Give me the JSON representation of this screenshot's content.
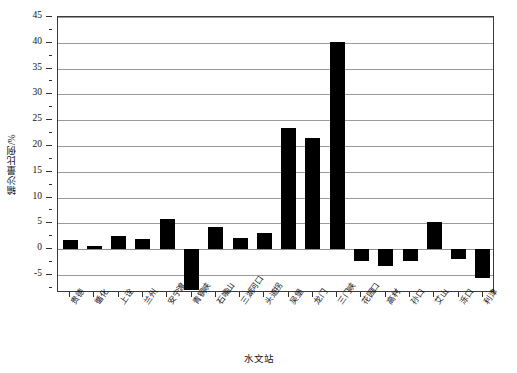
{
  "chart_data": {
    "type": "bar",
    "title": "",
    "xlabel": "水文站",
    "ylabel": "输沙量比例/%",
    "ylim": [
      -8.5,
      45
    ],
    "grid": true,
    "legend": "none",
    "bar_color": "#000000",
    "categories": [
      "贵德",
      "循化",
      "上诠",
      "兰州",
      "安宁渡",
      "青铜峡",
      "石嘴山",
      "三湖河口",
      "头道拐",
      "吴堡",
      "龙门",
      "三门峡",
      "花园口",
      "高村",
      "孙口",
      "艾山",
      "泺口",
      "利津"
    ],
    "values": [
      1.8,
      0.7,
      2.6,
      2.0,
      5.9,
      -7.9,
      4.2,
      2.2,
      3.2,
      23.4,
      21.5,
      40.2,
      -2.3,
      -3.3,
      -2.3,
      5.3,
      -1.9,
      -5.5
    ],
    "y_ticks_major": [
      45,
      40,
      35,
      30,
      25,
      20,
      15,
      10,
      5,
      0,
      -5
    ],
    "y_tick_labels": [
      "45",
      "40",
      "35",
      "30",
      "25",
      "20",
      "15",
      "10",
      "5",
      "0",
      "-5"
    ],
    "y_ticks_minor": [
      42.5,
      37.5,
      32.5,
      27.5,
      22.5,
      17.5,
      12.5,
      7.5,
      2.5,
      -2.5,
      -7.5
    ]
  }
}
